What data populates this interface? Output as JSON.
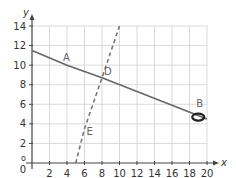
{
  "chart_data": {
    "type": "line",
    "title": "",
    "xlabel": "x",
    "ylabel": "y",
    "xlim": [
      0,
      20
    ],
    "ylim": [
      0,
      14
    ],
    "x_ticks": [
      2,
      4,
      6,
      8,
      10,
      12,
      14,
      16,
      18,
      20
    ],
    "y_ticks": [
      2,
      4,
      6,
      8,
      10,
      12,
      14
    ],
    "origin_label": "0",
    "origin_marker": "o",
    "grid": true,
    "legend": null,
    "series": [
      {
        "name": "solid-line",
        "style": "solid",
        "points": [
          [
            0,
            11.5
          ],
          [
            4,
            10
          ],
          [
            8,
            8.7
          ],
          [
            20,
            4.5
          ]
        ]
      },
      {
        "name": "dashed-line",
        "style": "dashed",
        "points": [
          [
            5,
            0
          ],
          [
            6,
            3.5
          ],
          [
            8,
            8.7
          ],
          [
            10,
            14
          ]
        ]
      }
    ],
    "annotations": [
      {
        "label": "A",
        "x": 4,
        "y": 10
      },
      {
        "label": "D",
        "x": 8,
        "y": 8.7
      },
      {
        "label": "E",
        "x": 6,
        "y": 3.5
      },
      {
        "label": "B",
        "x": 19,
        "y": 5
      }
    ]
  }
}
